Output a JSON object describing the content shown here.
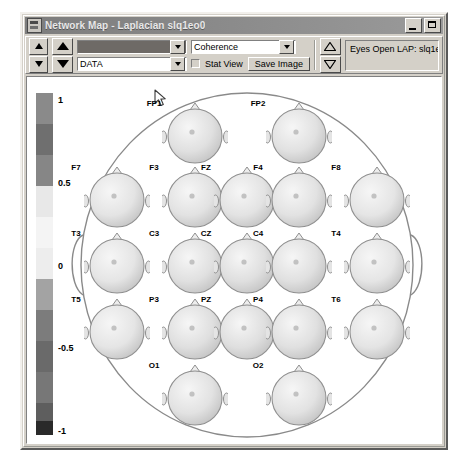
{
  "window": {
    "title": "Network Map - Laplacian slq1eo0",
    "icon": "app-icon",
    "minimize_label": "_",
    "maximize_label": "□"
  },
  "toolbar": {
    "spinner_small": {
      "up": "▲",
      "down": "▼"
    },
    "spinner_large": {
      "up": "▲",
      "down": "▼"
    },
    "spinner_right": {
      "up": "△",
      "down": "▽"
    },
    "combo_band": {
      "value": "",
      "arrow": "▼"
    },
    "combo_source": {
      "value": "DATA",
      "arrow": "▼"
    },
    "combo_measure": {
      "value": "Coherence",
      "arrow": "▼"
    },
    "stat_view": {
      "label": "Stat View",
      "checked": false
    },
    "save_image_label": "Save Image",
    "status_text": "Eyes Open LAP:  slq1eo0"
  },
  "colorbar": {
    "ticks": [
      {
        "label": "1",
        "pos": 2
      },
      {
        "label": "0.5",
        "pos": 26
      },
      {
        "label": "0",
        "pos": 50
      },
      {
        "label": "-0.5",
        "pos": 74
      },
      {
        "label": "-1",
        "pos": 98
      }
    ],
    "bands": [
      {
        "color": "#8a8a8a",
        "height": 9
      },
      {
        "color": "#6f6f6f",
        "height": 9
      },
      {
        "color": "#868686",
        "height": 9
      },
      {
        "color": "#e8e8e8",
        "height": 9
      },
      {
        "color": "#f4f4f4",
        "height": 9
      },
      {
        "color": "#ededed",
        "height": 9
      },
      {
        "color": "#a3a3a3",
        "height": 9
      },
      {
        "color": "#7c7c7c",
        "height": 9
      },
      {
        "color": "#6a6a6a",
        "height": 9
      },
      {
        "color": "#777777",
        "height": 9
      },
      {
        "color": "#5e5e5e",
        "height": 5
      },
      {
        "color": "#2a2a2a",
        "height": 4
      }
    ]
  },
  "chart_data": {
    "type": "heatmap",
    "title": "Network Map - Laplacian slq1eo0",
    "subtitle": "Eyes Open LAP:  slq1eo0",
    "measure": "Coherence",
    "montage": "10-20",
    "colorbar_range": [
      -1,
      1
    ],
    "colorbar_ticks": [
      1,
      0.5,
      0,
      -0.5,
      -1
    ],
    "electrodes": [
      {
        "label": "FP1",
        "x": 124,
        "y": 22,
        "row": 1,
        "value": 0.42
      },
      {
        "label": "FP2",
        "x": 228,
        "y": 22,
        "row": 1,
        "value": 0.38
      },
      {
        "label": "F7",
        "x": 46,
        "y": 86,
        "row": 2,
        "value": 0.21
      },
      {
        "label": "F3",
        "x": 124,
        "y": 86,
        "row": 2,
        "value": 0.34
      },
      {
        "label": "FZ",
        "x": 176,
        "y": 86,
        "row": 2,
        "value": 0.29
      },
      {
        "label": "F4",
        "x": 228,
        "y": 86,
        "row": 2,
        "value": 0.31
      },
      {
        "label": "F8",
        "x": 306,
        "y": 86,
        "row": 2,
        "value": 0.18
      },
      {
        "label": "T3",
        "x": 46,
        "y": 152,
        "row": 3,
        "value": 0.15
      },
      {
        "label": "C3",
        "x": 124,
        "y": 152,
        "row": 3,
        "value": 0.46
      },
      {
        "label": "CZ",
        "x": 176,
        "y": 152,
        "row": 3,
        "value": 0.52
      },
      {
        "label": "C4",
        "x": 228,
        "y": 152,
        "row": 3,
        "value": 0.44
      },
      {
        "label": "T4",
        "x": 306,
        "y": 152,
        "row": 3,
        "value": 0.17
      },
      {
        "label": "T5",
        "x": 46,
        "y": 218,
        "row": 4,
        "value": 0.19
      },
      {
        "label": "P3",
        "x": 124,
        "y": 218,
        "row": 4,
        "value": 0.48
      },
      {
        "label": "PZ",
        "x": 176,
        "y": 218,
        "row": 4,
        "value": 0.5
      },
      {
        "label": "P4",
        "x": 228,
        "y": 218,
        "row": 4,
        "value": 0.45
      },
      {
        "label": "T6",
        "x": 306,
        "y": 218,
        "row": 4,
        "value": 0.2
      },
      {
        "label": "O1",
        "x": 124,
        "y": 284,
        "row": 5,
        "value": 0.33
      },
      {
        "label": "O2",
        "x": 228,
        "y": 284,
        "row": 5,
        "value": 0.35
      }
    ]
  }
}
